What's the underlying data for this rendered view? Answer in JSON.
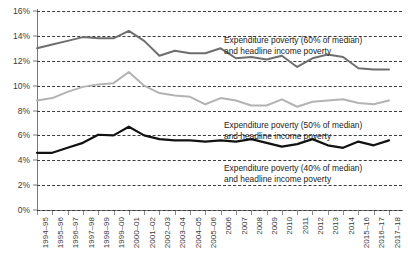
{
  "chart_data": {
    "type": "line",
    "title": "",
    "subtitle": "",
    "xlabel": "",
    "ylabel": "",
    "ylim": [
      0,
      16
    ],
    "ytick_labels": [
      "0%",
      "2%",
      "4%",
      "6%",
      "8%",
      "10%",
      "12%",
      "14%",
      "16%"
    ],
    "ytick_values": [
      0,
      2,
      4,
      6,
      8,
      10,
      12,
      14,
      16
    ],
    "grid": true,
    "legend_position": "inline-annotations",
    "categories": [
      "1994–95",
      "1995–96",
      "1996–97",
      "1997–98",
      "1998–99",
      "1999–00",
      "2000–01",
      "2001–02",
      "2002–03",
      "2003–04",
      "2004–05",
      "2005–06",
      "2006",
      "2007",
      "2008",
      "2009",
      "2010",
      "2011",
      "2012",
      "2013",
      "2014",
      "2015–16",
      "2016–17",
      "2017–18"
    ],
    "series": [
      {
        "name": "Expenditure poverty (60% of median) and headline income poverty",
        "color": "#6e6e6e",
        "width": 2.0,
        "values": [
          13.0,
          13.3,
          13.6,
          13.9,
          13.8,
          13.8,
          14.4,
          13.6,
          12.4,
          12.8,
          12.6,
          12.6,
          13.0,
          12.2,
          12.3,
          12.1,
          12.4,
          11.5,
          12.2,
          12.5,
          12.3,
          11.4,
          11.3,
          11.3
        ]
      },
      {
        "name": "Expenditure poverty (50% of median) and headline income poverty",
        "color": "#b3b3b3",
        "width": 2.0,
        "values": [
          8.8,
          9.0,
          9.5,
          9.9,
          10.1,
          10.2,
          11.1,
          10.0,
          9.4,
          9.2,
          9.1,
          8.5,
          9.0,
          8.8,
          8.4,
          8.4,
          8.9,
          8.3,
          8.7,
          8.8,
          8.9,
          8.6,
          8.5,
          8.8
        ]
      },
      {
        "name": "Expenditure poverty (40% of median) and headline income poverty",
        "color": "#121212",
        "width": 2.2,
        "values": [
          4.6,
          4.6,
          5.0,
          5.4,
          6.05,
          6.0,
          6.7,
          6.0,
          5.7,
          5.6,
          5.6,
          5.5,
          5.6,
          5.5,
          5.7,
          5.4,
          5.1,
          5.3,
          5.7,
          5.2,
          5.0,
          5.5,
          5.2,
          5.6
        ]
      }
    ],
    "annotations": [
      {
        "id": "annotation-60",
        "line1": "Expenditure poverty (60% of median)",
        "line2": "and headline income poverty"
      },
      {
        "id": "annotation-50",
        "line1": "Expenditure poverty (50% of median)",
        "line2": "and headline income poverty"
      },
      {
        "id": "annotation-40",
        "line1": "Expenditure poverty (40% of median)",
        "line2": "and headline income poverty"
      }
    ]
  }
}
